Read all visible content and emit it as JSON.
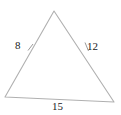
{
  "figure": {
    "type": "triangle-diagram",
    "background_color": "#ffffff",
    "stroke_color": "#b0b0b0",
    "tick_color": "#9a9a9a",
    "label_color": "#1a1a1a",
    "width": 121,
    "height": 115
  },
  "vertices": {
    "apex": {
      "name": "top-vertex",
      "x": 54,
      "y": 11
    },
    "bottom_left": {
      "name": "bottom-left-vertex",
      "x": 5,
      "y": 97
    },
    "bottom_right": {
      "name": "bottom-right-vertex",
      "x": 114,
      "y": 102
    }
  },
  "sides": [
    {
      "id": "side-a",
      "position": "left",
      "label": "8",
      "from": "bottom_left",
      "to": "apex",
      "has_tick": true
    },
    {
      "id": "side-b",
      "position": "right",
      "label": "12",
      "from": "apex",
      "to": "bottom_right",
      "has_tick": true
    },
    {
      "id": "side-c",
      "position": "bottom",
      "label": "15",
      "from": "bottom_left",
      "to": "bottom_right",
      "has_tick": false
    }
  ],
  "ticks": [
    {
      "id": "tick-left",
      "x1": 28,
      "y1": 50,
      "x2": 33,
      "y2": 44
    },
    {
      "id": "tick-right",
      "x1": 85,
      "y1": 43,
      "x2": 88,
      "y2": 51
    }
  ]
}
